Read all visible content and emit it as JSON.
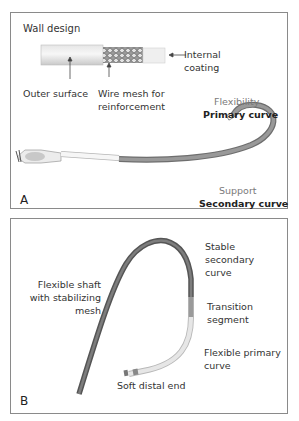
{
  "panel_a": {
    "letter": "A",
    "title": "Wall design",
    "labels": {
      "internal_coating_1": "Internal",
      "internal_coating_2": "coating",
      "outer_surface": "Outer surface",
      "wire_mesh_1": "Wire mesh for",
      "wire_mesh_2": "reinforcement",
      "flexibility": "Flexibility",
      "primary_curve": "Primary curve",
      "support": "Support",
      "secondary_curve": "Secondary curve"
    }
  },
  "panel_b": {
    "letter": "B",
    "labels": {
      "shaft_1": "Flexible shaft",
      "shaft_2": "with stabilizing",
      "shaft_3": "mesh",
      "stable_1": "Stable",
      "stable_2": "secondary",
      "stable_3": "curve",
      "transition_1": "Transition",
      "transition_2": "segment",
      "flex_primary_1": "Flexible primary",
      "flex_primary_2": "curve",
      "soft_end": "Soft distal end"
    }
  },
  "colors": {
    "border": "#8a8a8a",
    "catheter_dark": "#5f5f5f",
    "catheter_mid": "#8e8e8e",
    "catheter_light": "#dcdcdc",
    "label_gray": "#7a7a7a"
  }
}
